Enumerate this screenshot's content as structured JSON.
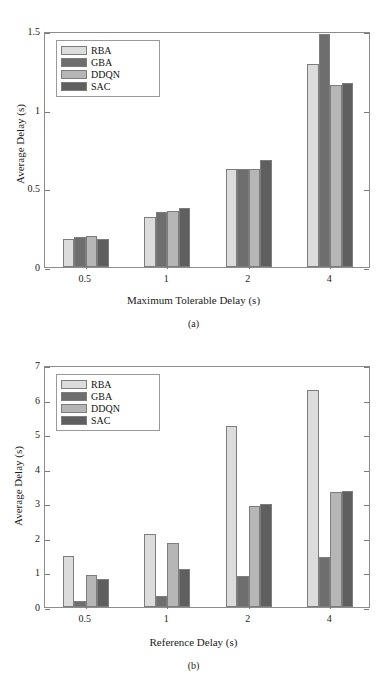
{
  "chart_data": [
    {
      "id": "a",
      "type": "bar",
      "title": "",
      "caption": "(a)",
      "xlabel": "Maximum Tolerable Delay (s)",
      "ylabel": "Average Delay (s)",
      "categories": [
        "0.5",
        "1",
        "2",
        "4"
      ],
      "ylim": [
        0,
        1.5
      ],
      "yticks": [
        0,
        0.5,
        1,
        1.5
      ],
      "ytick_labels": [
        "0",
        "0.5",
        "1",
        "1.5"
      ],
      "grid": false,
      "legend_position": "top-left",
      "series": [
        {
          "name": "RBA",
          "color": "#dcdcdc",
          "values": [
            0.18,
            0.32,
            0.62,
            1.29
          ]
        },
        {
          "name": "GBA",
          "color": "#6e6e6e",
          "values": [
            0.19,
            0.35,
            0.62,
            1.48
          ]
        },
        {
          "name": "DDQN",
          "color": "#b6b6b6",
          "values": [
            0.2,
            0.355,
            0.62,
            1.16
          ]
        },
        {
          "name": "SAC",
          "color": "#5f5f5f",
          "values": [
            0.18,
            0.375,
            0.68,
            1.17
          ]
        }
      ]
    },
    {
      "id": "b",
      "type": "bar",
      "title": "",
      "caption": "(b)",
      "xlabel": "Reference Delay (s)",
      "ylabel": "Average Delay (s)",
      "categories": [
        "0.5",
        "1",
        "2",
        "4"
      ],
      "ylim": [
        0,
        7
      ],
      "yticks": [
        0,
        1,
        2,
        3,
        4,
        5,
        6,
        7
      ],
      "ytick_labels": [
        "0",
        "1",
        "2",
        "3",
        "4",
        "5",
        "6",
        "7"
      ],
      "grid": false,
      "legend_position": "top-left",
      "series": [
        {
          "name": "RBA",
          "color": "#dcdcdc",
          "values": [
            1.47,
            2.12,
            5.25,
            6.28
          ]
        },
        {
          "name": "GBA",
          "color": "#6e6e6e",
          "values": [
            0.17,
            0.32,
            0.89,
            1.45
          ]
        },
        {
          "name": "DDQN",
          "color": "#b6b6b6",
          "values": [
            0.92,
            1.84,
            2.93,
            3.33
          ]
        },
        {
          "name": "SAC",
          "color": "#5f5f5f",
          "values": [
            0.8,
            1.1,
            2.97,
            3.37
          ]
        }
      ]
    }
  ]
}
